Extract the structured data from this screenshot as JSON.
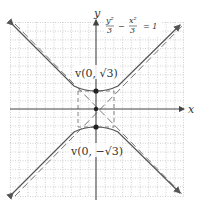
{
  "diagram": {
    "type": "hyperbola-graph",
    "equation": {
      "text": "y²/3 − x²/3 = 1",
      "numerator_left": "y²",
      "denominator_left": "3",
      "operator": "−",
      "numerator_right": "x²",
      "denominator_right": "3",
      "equals": "= 1"
    },
    "axes": {
      "x_label": "x",
      "y_label": "y"
    },
    "vertices": [
      {
        "label": "v(0, √3)",
        "x": 0,
        "y": 1.732
      },
      {
        "label": "v(0, −√3)",
        "x": 0,
        "y": -1.732
      }
    ],
    "center": {
      "x": 0,
      "y": 0
    },
    "asymptotes": [
      "y = x",
      "y = −x"
    ],
    "central_rectangle": {
      "half_width": 1.732,
      "half_height": 1.732,
      "style": "dashed"
    },
    "colors": {
      "curve": "#555555",
      "axis": "#444444",
      "grid": "#bbbbbb",
      "asymptote": "#777777",
      "point": "#222222"
    }
  }
}
